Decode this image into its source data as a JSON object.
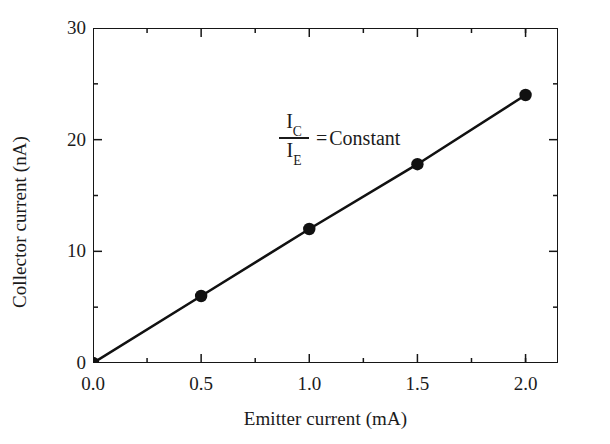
{
  "chart_data": {
    "type": "line",
    "title": "",
    "xlabel": "Emitter current (mA)",
    "ylabel": "Collector current (nA)",
    "xlim": [
      0.0,
      2.15
    ],
    "ylim": [
      0,
      30
    ],
    "grid": false,
    "legend": null,
    "x": [
      0.0,
      0.5,
      1.0,
      1.5,
      2.0
    ],
    "values": [
      0.0,
      6.0,
      12.0,
      17.8,
      24.0
    ],
    "series": [
      {
        "name": "Collector current vs emitter current",
        "x": [
          0.0,
          0.5,
          1.0,
          1.5,
          2.0
        ],
        "values": [
          0.0,
          6.0,
          12.0,
          17.8,
          24.0
        ],
        "marker": "filled-circle",
        "color": "#111111"
      }
    ],
    "xticks": [
      {
        "value": 0.0,
        "label": "0.0"
      },
      {
        "value": 0.5,
        "label": "0.5"
      },
      {
        "value": 1.0,
        "label": "1.0"
      },
      {
        "value": 1.5,
        "label": "1.5"
      },
      {
        "value": 2.0,
        "label": "2.0"
      }
    ],
    "x_minor_ticks": [
      0.25,
      0.75,
      1.25,
      1.75,
      2.0
    ],
    "yticks": [
      {
        "value": 0,
        "label": "0"
      },
      {
        "value": 10,
        "label": "10"
      },
      {
        "value": 20,
        "label": "20"
      },
      {
        "value": 30,
        "label": "30"
      }
    ],
    "y_minor_ticks": [
      5,
      15,
      25
    ],
    "annotations": [
      {
        "numerator": "I",
        "numerator_sub": "C",
        "denominator": "I",
        "denominator_sub": "E",
        "equals": "=",
        "text": "Constant",
        "full_text": "I_C / I_E = Constant"
      }
    ]
  },
  "axis": {
    "xlabel": "Emitter current (mA)",
    "ylabel": "Collector current (nA)"
  },
  "annotation": {
    "num_symbol": "I",
    "num_sub": "C",
    "den_symbol": "I",
    "den_sub": "E",
    "equals": "=",
    "constant": "Constant"
  },
  "colors": {
    "line": "#111111",
    "marker": "#111111",
    "axis": "#161616",
    "text": "#1b1b1b",
    "background": "#ffffff"
  }
}
